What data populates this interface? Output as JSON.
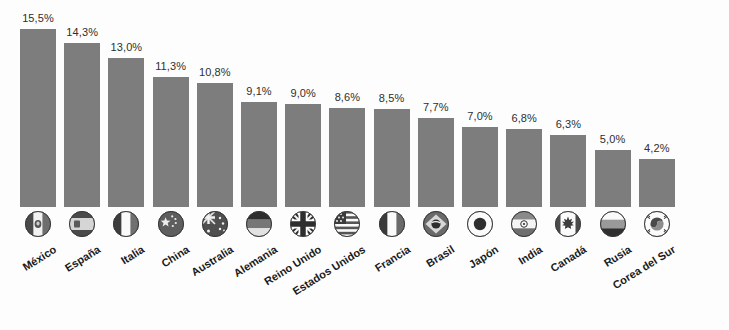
{
  "chart_data": {
    "type": "bar",
    "title": "",
    "subtitle": "",
    "xlabel": "",
    "ylabel": "",
    "ylim": [
      0,
      16
    ],
    "grid": false,
    "legend": "none",
    "value_suffix": "%",
    "decimal_separator": ",",
    "bar_color": "#7d7d7d",
    "background_color": "#fdfdfd",
    "label_color": "#1a1a1a",
    "value_label_color": "#2f2f2f",
    "categories": [
      "México",
      "España",
      "Italia",
      "China",
      "Australia",
      "Alemania",
      "Reino Unido",
      "Estados Unidos",
      "Francia",
      "Brasil",
      "Japón",
      "India",
      "Canadá",
      "Rusia",
      "Corea del Sur"
    ],
    "values": [
      15.5,
      14.3,
      13.0,
      11.3,
      10.8,
      9.1,
      9.0,
      8.6,
      8.5,
      7.7,
      7.0,
      6.8,
      6.3,
      5.0,
      4.2
    ],
    "value_labels": [
      "15,5%",
      "14,3%",
      "13,0%",
      "11,3%",
      "10,8%",
      "9,1%",
      "9,0%",
      "8,6%",
      "8,5%",
      "7,7%",
      "7,0%",
      "6,8%",
      "6,3%",
      "5,0%",
      "4,2%"
    ],
    "icons": [
      "flag-mexico-icon",
      "flag-spain-icon",
      "flag-italy-icon",
      "flag-china-icon",
      "flag-australia-icon",
      "flag-germany-icon",
      "flag-united-kingdom-icon",
      "flag-united-states-icon",
      "flag-france-icon",
      "flag-brazil-icon",
      "flag-japan-icon",
      "flag-india-icon",
      "flag-canada-icon",
      "flag-russia-icon",
      "flag-south-korea-icon"
    ]
  }
}
